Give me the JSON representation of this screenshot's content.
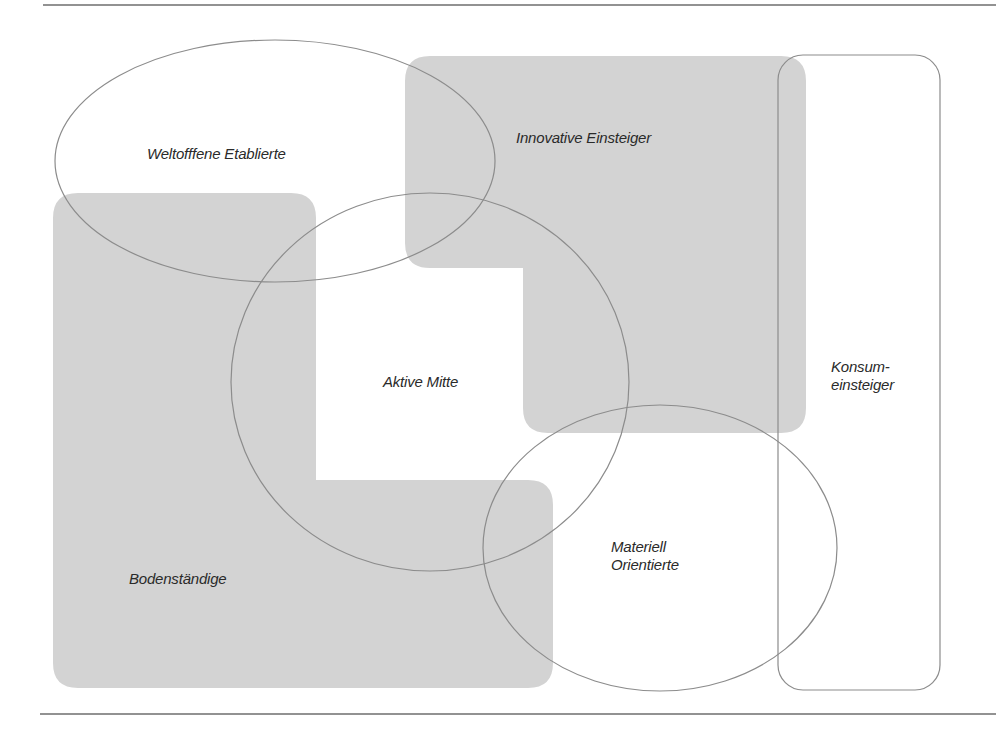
{
  "diagram": {
    "type": "segment-overlap-diagram",
    "colors": {
      "fill_gray": "#d3d3d3",
      "stroke": "#8c8c8c",
      "rule": "#6e6e6e",
      "text": "#2a2a2a"
    },
    "segments": {
      "weltoffene": {
        "label": "Weltofffene Etablierte",
        "shape": "ellipse-outline"
      },
      "innovative": {
        "label": "Innovative Einsteiger",
        "shape": "gray-filled-area"
      },
      "aktive": {
        "label": "Aktive Mitte",
        "shape": "circle-outline"
      },
      "bodenstaendige": {
        "label": "Bodenständige",
        "shape": "gray-filled-area"
      },
      "materiell": {
        "label_line1": "Materiell",
        "label_line2": "Orientierte",
        "shape": "ellipse-outline"
      },
      "konsum": {
        "label_line1": "Konsum-",
        "label_line2": "einsteiger",
        "shape": "rounded-rect-outline"
      }
    }
  }
}
